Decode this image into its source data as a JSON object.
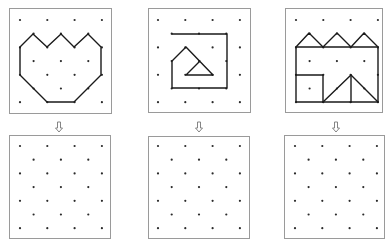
{
  "colors": {
    "background": "#ffffff",
    "frame": "#9a9a9a",
    "dot": "#2a2a2a",
    "line": "#1a1a1a",
    "arrow": "#777777"
  },
  "lattice": {
    "description": "Offset dot lattice: rows alternate 4 dots and 3 offset dots (7 rows)",
    "full_rows": [
      0,
      2,
      4,
      6
    ],
    "offset_rows": [
      1,
      3,
      5
    ],
    "row_step": 13.7,
    "col_step": 27.3
  },
  "panels": [
    {
      "id": "example-1",
      "position": "top-left",
      "frame": {
        "x": 9,
        "y": 8,
        "w": 102,
        "h": 105
      },
      "origin": {
        "x": 20,
        "y": 20
      },
      "figure": "tulip / crown heart shape",
      "polylines": [
        [
          [
            20,
            47
          ],
          [
            33,
            34
          ],
          [
            47,
            47
          ],
          [
            61,
            34
          ],
          [
            74,
            47
          ],
          [
            88,
            34
          ],
          [
            101,
            47
          ],
          [
            101,
            75
          ],
          [
            88,
            88
          ],
          [
            74,
            102
          ],
          [
            47,
            102
          ],
          [
            33,
            88
          ],
          [
            20,
            75
          ],
          [
            20,
            47
          ]
        ]
      ]
    },
    {
      "id": "example-2",
      "position": "top-middle",
      "frame": {
        "x": 148,
        "y": 8,
        "w": 102,
        "h": 104
      },
      "origin": {
        "x": 158,
        "y": 20
      },
      "figure": "spiral with triangle",
      "polylines": [
        [
          [
            172,
            34
          ],
          [
            227,
            34
          ],
          [
            227,
            88
          ],
          [
            172,
            88
          ],
          [
            172,
            61
          ],
          [
            186,
            47
          ],
          [
            213,
            75
          ],
          [
            186,
            75
          ],
          [
            200,
            61
          ]
        ]
      ]
    },
    {
      "id": "example-3",
      "position": "top-right",
      "frame": {
        "x": 285,
        "y": 8,
        "w": 97,
        "h": 104
      },
      "origin": {
        "x": 296,
        "y": 20
      },
      "figure": "house row with square and triangle",
      "polylines": [
        [
          [
            296,
            47
          ],
          [
            309,
            33
          ],
          [
            323,
            47
          ],
          [
            337,
            33
          ],
          [
            351,
            47
          ],
          [
            364,
            33
          ],
          [
            378,
            47
          ]
        ],
        [
          [
            296,
            47
          ],
          [
            378,
            47
          ],
          [
            378,
            102
          ],
          [
            296,
            102
          ],
          [
            296,
            47
          ]
        ],
        [
          [
            296,
            75
          ],
          [
            323,
            75
          ],
          [
            323,
            102
          ]
        ],
        [
          [
            323,
            102
          ],
          [
            351,
            75
          ],
          [
            378,
            102
          ]
        ],
        [
          [
            351,
            75
          ],
          [
            351,
            102
          ]
        ]
      ]
    },
    {
      "id": "blank-1",
      "position": "bottom-left",
      "frame": {
        "x": 9,
        "y": 135,
        "w": 101,
        "h": 103
      },
      "origin": {
        "x": 20,
        "y": 146
      },
      "figure": "empty grid",
      "polylines": []
    },
    {
      "id": "blank-2",
      "position": "bottom-middle",
      "frame": {
        "x": 148,
        "y": 136,
        "w": 101,
        "h": 102
      },
      "origin": {
        "x": 158,
        "y": 146
      },
      "figure": "empty grid",
      "polylines": []
    },
    {
      "id": "blank-3",
      "position": "bottom-right",
      "frame": {
        "x": 284,
        "y": 135,
        "w": 100,
        "h": 103
      },
      "origin": {
        "x": 295,
        "y": 146
      },
      "figure": "empty grid",
      "polylines": []
    }
  ],
  "arrows": [
    {
      "id": "arrow-1",
      "glyph": "down-hollow-arrow",
      "x": 59,
      "y": 122
    },
    {
      "id": "arrow-2",
      "glyph": "down-hollow-arrow",
      "x": 199,
      "y": 122
    },
    {
      "id": "arrow-3",
      "glyph": "down-hollow-arrow",
      "x": 336,
      "y": 122
    }
  ]
}
